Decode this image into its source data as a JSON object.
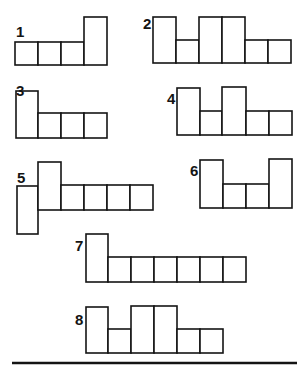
{
  "figures": [
    {
      "id": "1",
      "label": "1",
      "label_pos": [
        16,
        37
      ],
      "cells": [
        [
          15,
          42,
          23,
          23
        ],
        [
          38,
          42,
          23,
          23
        ],
        [
          61,
          42,
          23,
          23
        ],
        [
          84,
          17,
          23,
          48
        ]
      ]
    },
    {
      "id": "2",
      "label": "2",
      "label_pos": [
        143,
        29
      ],
      "cells": [
        [
          153,
          17,
          23,
          46
        ],
        [
          176,
          40,
          23,
          23
        ],
        [
          199,
          17,
          23,
          46
        ],
        [
          222,
          17,
          23,
          46
        ],
        [
          245,
          40,
          23,
          23
        ],
        [
          268,
          40,
          23,
          23
        ]
      ]
    },
    {
      "id": "3",
      "label": "3",
      "label_pos": [
        16,
        96
      ],
      "cells": [
        [
          16,
          91,
          22,
          47
        ],
        [
          38,
          113,
          23,
          25
        ],
        [
          61,
          113,
          23,
          25
        ],
        [
          84,
          113,
          23,
          25
        ]
      ]
    },
    {
      "id": "4",
      "label": "4",
      "label_pos": [
        167,
        104
      ],
      "cells": [
        [
          177,
          88,
          23,
          47
        ],
        [
          200,
          111,
          22,
          24
        ],
        [
          222,
          87,
          24,
          48
        ],
        [
          246,
          111,
          23,
          24
        ],
        [
          269,
          111,
          23,
          24
        ]
      ]
    },
    {
      "id": "5",
      "label": "5",
      "label_pos": [
        17,
        183
      ],
      "cells": [
        [
          17,
          186,
          21,
          48
        ],
        [
          38,
          162,
          23,
          48
        ],
        [
          61,
          185,
          23,
          25
        ],
        [
          84,
          185,
          23,
          25
        ],
        [
          107,
          185,
          23,
          25
        ],
        [
          130,
          185,
          23,
          25
        ]
      ]
    },
    {
      "id": "6",
      "label": "6",
      "label_pos": [
        190,
        176
      ],
      "cells": [
        [
          200,
          160,
          23,
          48
        ],
        [
          223,
          184,
          23,
          24
        ],
        [
          246,
          184,
          23,
          24
        ],
        [
          269,
          159,
          23,
          49
        ]
      ]
    },
    {
      "id": "7",
      "label": "7",
      "label_pos": [
        75,
        251
      ],
      "cells": [
        [
          86,
          234,
          22,
          48
        ],
        [
          108,
          257,
          23,
          25
        ],
        [
          131,
          257,
          23,
          25
        ],
        [
          154,
          257,
          23,
          25
        ],
        [
          177,
          257,
          23,
          25
        ],
        [
          200,
          257,
          23,
          25
        ],
        [
          223,
          257,
          23,
          25
        ]
      ]
    },
    {
      "id": "8",
      "label": "8",
      "label_pos": [
        75,
        325
      ],
      "cells": [
        [
          86,
          307,
          22,
          46
        ],
        [
          108,
          329,
          23,
          24
        ],
        [
          131,
          306,
          23,
          47
        ],
        [
          154,
          306,
          23,
          47
        ],
        [
          177,
          329,
          23,
          24
        ],
        [
          200,
          329,
          23,
          24
        ]
      ]
    }
  ],
  "separator": {
    "x1": 12,
    "x2": 297,
    "y": 363
  },
  "colors": {
    "ink": "#141414",
    "background": "#ffffff"
  }
}
